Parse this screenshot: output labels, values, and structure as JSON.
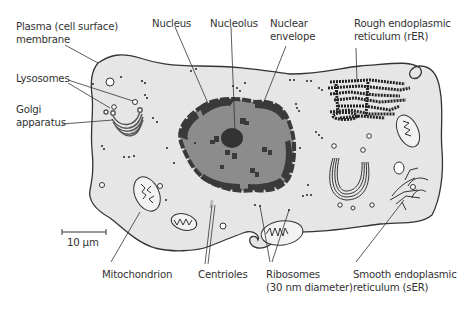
{
  "diagram": {
    "type": "animal-cell",
    "colors": {
      "cytoplasm": "#e6e6e6",
      "outline": "#333333",
      "nucleus": "#8c8c8c",
      "chromatin": "#3a3a3a",
      "ribosome": "#222222"
    },
    "labels": {
      "plasma_membrane": {
        "line1": "Plasma (cell surface)",
        "line2": "membrane"
      },
      "nucleus": {
        "line1": "Nucleus"
      },
      "nucleolus": {
        "line1": "Nucleolus"
      },
      "nuclear_envelope": {
        "line1": "Nuclear",
        "line2": "envelope"
      },
      "rough_er": {
        "line1": "Rough endoplasmic",
        "line2": "reticulum (rER)"
      },
      "lysosomes": {
        "line1": "Lysosomes"
      },
      "golgi": {
        "line1": "Golgi",
        "line2": "apparatus"
      },
      "mitochondrion": {
        "line1": "Mitochondrion"
      },
      "centrioles": {
        "line1": "Centrioles"
      },
      "ribosomes": {
        "line1": "Ribosomes",
        "line2": "(30 nm diameter)"
      },
      "smooth_er": {
        "line1": "Smooth endoplasmic",
        "line2": "reticulum (sER)"
      }
    },
    "scale_bar": {
      "label": "10 µm"
    }
  }
}
